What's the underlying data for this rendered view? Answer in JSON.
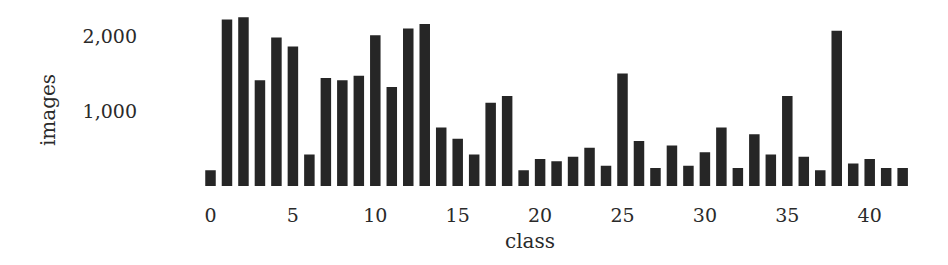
{
  "chart_data": {
    "type": "bar",
    "title": "",
    "xlabel": "class",
    "ylabel": "images",
    "categories": [
      0,
      1,
      2,
      3,
      4,
      5,
      6,
      7,
      8,
      9,
      10,
      11,
      12,
      13,
      14,
      15,
      16,
      17,
      18,
      19,
      20,
      21,
      22,
      23,
      24,
      25,
      26,
      27,
      28,
      29,
      30,
      31,
      32,
      33,
      34,
      35,
      36,
      37,
      38,
      39,
      40,
      41,
      42
    ],
    "values": [
      210,
      2220,
      2250,
      1410,
      1980,
      1860,
      420,
      1440,
      1410,
      1470,
      2010,
      1320,
      2100,
      2160,
      780,
      630,
      420,
      1110,
      1200,
      210,
      360,
      330,
      390,
      510,
      270,
      1500,
      600,
      240,
      540,
      270,
      450,
      780,
      240,
      690,
      420,
      1200,
      390,
      210,
      2070,
      300,
      360,
      240,
      240
    ],
    "x_ticks": [
      "0",
      "5",
      "10",
      "15",
      "20",
      "25",
      "30",
      "35",
      "40"
    ],
    "x_tick_positions": [
      0,
      5,
      10,
      15,
      20,
      25,
      30,
      35,
      40
    ],
    "y_ticks": [
      "1,000",
      "2,000"
    ],
    "y_tick_values": [
      1000,
      2000
    ],
    "ylim": [
      0,
      2300
    ],
    "grid": false,
    "legend": null,
    "bar_color": "#262626"
  }
}
